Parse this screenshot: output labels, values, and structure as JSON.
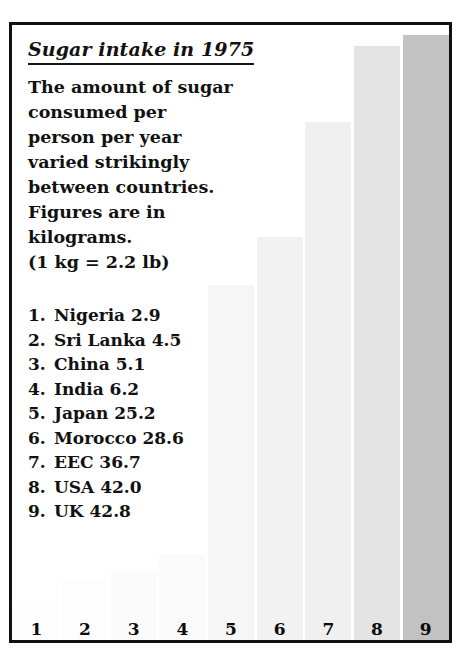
{
  "panel": {
    "title": "Sugar intake in 1975",
    "description": "The amount of sugar\nconsumed per\nperson per year\nvaried strikingly\nbetween countries.\nFigures are in\nkilograms.",
    "conversion_note": "(1 kg = 2.2 lb)"
  },
  "colors": {
    "frame": "#111111",
    "text": "#111111",
    "bar_1": "#fefefe",
    "bar_2": "#fdfdfd",
    "bar_3": "#fbfbfb",
    "bar_4": "#fafafa",
    "bar_5": "#f6f6f6",
    "bar_6": "#f2f2f2",
    "bar_7": "#f0f0f0",
    "bar_8": "#e4e4e4",
    "bar_9": "#c2c2c2"
  },
  "list": [
    {
      "rank": "1.",
      "name": "Nigeria",
      "value": "2.9"
    },
    {
      "rank": "2.",
      "name": "Sri Lanka",
      "value": "4.5"
    },
    {
      "rank": "3.",
      "name": "China",
      "value": "5.1"
    },
    {
      "rank": "4.",
      "name": "India",
      "value": "6.2"
    },
    {
      "rank": "5.",
      "name": "Japan",
      "value": "25.2"
    },
    {
      "rank": "6.",
      "name": "Morocco",
      "value": "28.6"
    },
    {
      "rank": "7.",
      "name": "EEC",
      "value": "36.7"
    },
    {
      "rank": "8.",
      "name": "USA",
      "value": "42.0"
    },
    {
      "rank": "9.",
      "name": "UK",
      "value": "42.8"
    }
  ],
  "axis": {
    "ticks": [
      "1",
      "2",
      "3",
      "4",
      "5",
      "6",
      "7",
      "8",
      "9"
    ]
  },
  "chart_data": {
    "type": "bar",
    "title": "Sugar intake in 1975",
    "subtitle": "The amount of sugar consumed per person per year varied strikingly between countries. Figures are in kilograms. (1 kg = 2.2 lb)",
    "xlabel": "",
    "ylabel": "Kilograms per person per year",
    "categories": [
      "Nigeria",
      "Sri Lanka",
      "China",
      "India",
      "Japan",
      "Morocco",
      "EEC",
      "USA",
      "UK"
    ],
    "tick_labels": [
      "1",
      "2",
      "3",
      "4",
      "5",
      "6",
      "7",
      "8",
      "9"
    ],
    "values": [
      2.9,
      4.5,
      5.1,
      6.2,
      25.2,
      28.6,
      36.7,
      42.0,
      42.8
    ],
    "ylim": [
      0,
      43.5
    ],
    "grid": false,
    "legend": null,
    "bar_colors": [
      "#fefefe",
      "#fdfdfd",
      "#fbfbfb",
      "#fafafa",
      "#f6f6f6",
      "#f2f2f2",
      "#f0f0f0",
      "#e4e4e4",
      "#c2c2c2"
    ]
  }
}
